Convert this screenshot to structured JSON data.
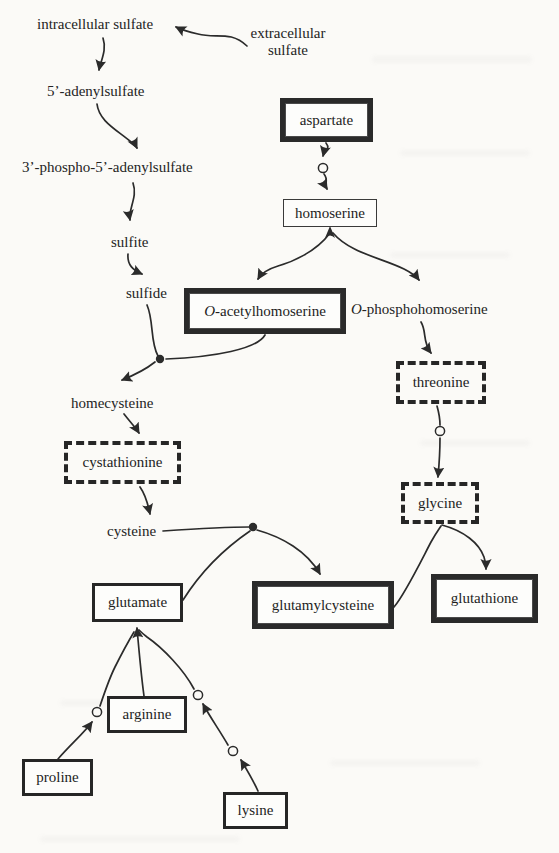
{
  "nodes": {
    "intracellular_sulfate": {
      "label": "intracellular sulfate"
    },
    "extracellular_sulfate": {
      "line1": "extracellular",
      "line2": "sulfate"
    },
    "adenylsulfate": {
      "label": "5’-adenylsulfate"
    },
    "phospho_adenylsulfate": {
      "label": "3’-phospho-5’-adenylsulfate"
    },
    "sulfite": {
      "label": "sulfite"
    },
    "sulfide": {
      "label": "sulfide"
    },
    "aspartate": {
      "label": "aspartate"
    },
    "homoserine": {
      "label": "homoserine"
    },
    "o_acetylhomoserine": {
      "italic": "O",
      "rest": "-acetylhomoserine"
    },
    "o_phosphohomoserine": {
      "italic": "O",
      "rest": "-phosphohomoserine"
    },
    "threonine": {
      "label": "threonine"
    },
    "homecysteine": {
      "label": "homecysteine"
    },
    "cystathionine": {
      "label": "cystathionine"
    },
    "cysteine": {
      "label": "cysteine"
    },
    "glycine": {
      "label": "glycine"
    },
    "glutamate": {
      "label": "glutamate"
    },
    "glutamylcysteine": {
      "label": "glutamylcysteine"
    },
    "glutathione": {
      "label": "glutathione"
    },
    "arginine": {
      "label": "arginine"
    },
    "proline": {
      "label": "proline"
    },
    "lysine": {
      "label": "lysine"
    }
  },
  "colors": {
    "ink": "#2b2b2b",
    "paper": "#fbfaf7"
  }
}
